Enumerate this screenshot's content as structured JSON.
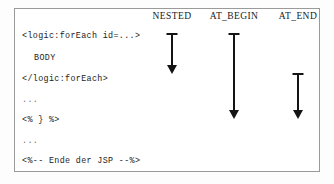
{
  "figure": {
    "name": "jsp-variable-scope-diagram",
    "border_color": "#9a9a9a",
    "background": "#ffffff",
    "ink_color": "#141414"
  },
  "columns": [
    {
      "id": "nested",
      "label": "NESTED",
      "center_x": 172
    },
    {
      "id": "at_begin",
      "label": "AT_BEGIN",
      "center_x": 234
    },
    {
      "id": "at_end",
      "label": "AT_END",
      "center_x": 298
    }
  ],
  "code_lines": [
    {
      "id": "line-open-tag",
      "text": "<logic:forEach id=...>",
      "indent": false,
      "faint": false,
      "top": 31
    },
    {
      "id": "line-body",
      "text": "BODY",
      "indent": true,
      "faint": false,
      "top": 53
    },
    {
      "id": "line-close-tag",
      "text": "</logic:forEach>",
      "indent": false,
      "faint": false,
      "top": 74
    },
    {
      "id": "line-ellipsis-1",
      "text": "...",
      "indent": false,
      "faint": true,
      "top": 95
    },
    {
      "id": "line-scriptlet",
      "text": "<% } %>",
      "indent": false,
      "faint": false,
      "top": 115
    },
    {
      "id": "line-ellipsis-2",
      "text": "...",
      "indent": false,
      "faint": true,
      "top": 136
    },
    {
      "id": "line-comment",
      "text": "<%-- Ende der JSP --%>",
      "indent": false,
      "faint": false,
      "top": 156
    }
  ],
  "arrows": [
    {
      "id": "arrow-nested",
      "column": "NESTED",
      "center_x": 172,
      "top": 33,
      "bottom": 74,
      "description": "scope spans the tag body only"
    },
    {
      "id": "arrow-at-begin",
      "column": "AT_BEGIN",
      "center_x": 234,
      "top": 33,
      "bottom": 119,
      "description": "scope spans from tag start to end of page"
    },
    {
      "id": "arrow-at-end",
      "column": "AT_END",
      "center_x": 298,
      "top": 73,
      "bottom": 119,
      "description": "scope spans from tag end to end of page"
    }
  ]
}
